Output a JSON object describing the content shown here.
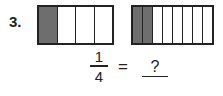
{
  "problem": {
    "number": "3.",
    "bar_left": {
      "parts": 4,
      "shaded": 1
    },
    "bar_right": {
      "parts": 8,
      "shaded": 2
    },
    "fraction": {
      "numerator": "1",
      "denominator": "4"
    },
    "equals": "=",
    "answer_placeholder": "?"
  },
  "colors": {
    "shaded": "#6e6e6e",
    "outline": "#222222"
  }
}
